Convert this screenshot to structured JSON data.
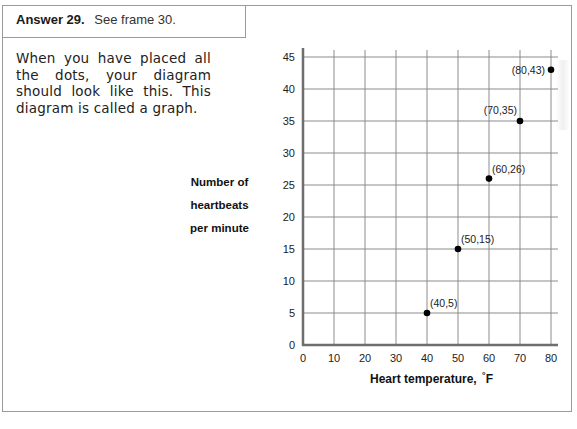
{
  "header": {
    "label": "Answer 29.",
    "text": "See frame 30."
  },
  "body": {
    "paragraph": "When you have placed all the dots, your diagram should look like this. This diagram is called a graph."
  },
  "chart_data": {
    "type": "scatter",
    "title": "",
    "xlabel": "Heart temperature, °F",
    "ylabel": "Number of heartbeats per minute",
    "ylabel_lines": [
      "Number of",
      "heartbeats",
      "per minute"
    ],
    "xlim": [
      0,
      80
    ],
    "ylim": [
      0,
      45
    ],
    "x_ticks": [
      0,
      10,
      20,
      30,
      40,
      50,
      60,
      70,
      80
    ],
    "y_ticks": [
      0,
      5,
      10,
      15,
      20,
      25,
      30,
      35,
      40,
      45
    ],
    "grid": true,
    "points": [
      {
        "x": 40,
        "y": 5,
        "label": "(40,5)"
      },
      {
        "x": 50,
        "y": 15,
        "label": "(50,15)"
      },
      {
        "x": 60,
        "y": 26,
        "label": "(60,26)"
      },
      {
        "x": 70,
        "y": 35,
        "label": "(70,35)"
      },
      {
        "x": 80,
        "y": 43,
        "label": "(80,43)"
      }
    ],
    "colors": {
      "point": "#000000",
      "grid": "#8c8c8c",
      "axis": "#6e6e6e"
    }
  },
  "xlabel": {
    "main": "Heart temperature,",
    "unit_degree": "°",
    "unit": "F"
  }
}
